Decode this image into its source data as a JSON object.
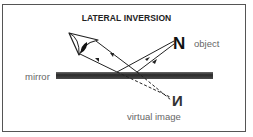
{
  "diagram": {
    "title": "LATERAL INVERSION",
    "labels": {
      "object": "object",
      "mirror": "mirror",
      "virtual_image": "virtual image"
    },
    "glyphs": {
      "object_letter": "N",
      "virtual_letter": "N"
    },
    "icons": {
      "eye": "eye-icon"
    },
    "colors": {
      "border": "#555555",
      "mirror": "#3a3a3a",
      "ray": "#222222",
      "label": "#666666",
      "title": "#222222"
    }
  }
}
